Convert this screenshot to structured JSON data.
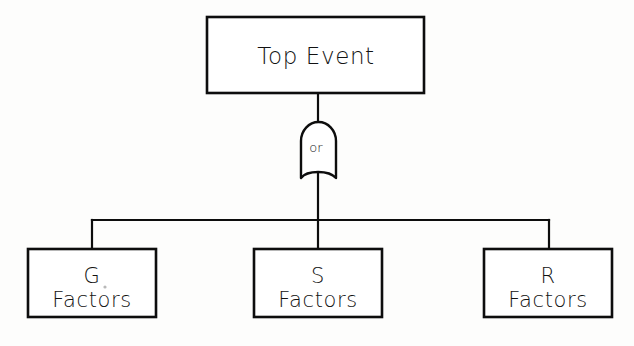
{
  "diagram": {
    "type": "fault-tree",
    "background_color": "#fdfdfc",
    "ink_color": "#0d0d0d",
    "top_event": {
      "label": "Top Event",
      "x": 207,
      "y": 17,
      "width": 217,
      "height": 76
    },
    "gate": {
      "label": "or",
      "kind": "or-gate",
      "x": 301,
      "y": 122,
      "width": 35,
      "height": 56
    },
    "bus": {
      "y": 220,
      "x_start": 92,
      "x_end": 549
    },
    "leaves": [
      {
        "line1": "G",
        "line2": "Factors",
        "x": 28,
        "y": 249,
        "width": 128,
        "height": 68,
        "stem_x": 92
      },
      {
        "line1": "S",
        "line2": "Factors",
        "x": 254,
        "y": 249,
        "width": 128,
        "height": 68,
        "stem_x": 317
      },
      {
        "line1": "R",
        "line2": "Factors",
        "x": 484,
        "y": 249,
        "width": 128,
        "height": 68,
        "stem_x": 549
      }
    ]
  }
}
